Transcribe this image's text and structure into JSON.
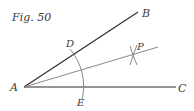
{
  "figure": {
    "caption": "Fig. 50"
  },
  "points": {
    "A": "A",
    "B": "B",
    "C": "C",
    "D": "D",
    "E": "E",
    "P": "P"
  },
  "colors": {
    "ray": "#2a2a2a",
    "construction": "#7a7a7a",
    "label": "#3a3a3a"
  }
}
